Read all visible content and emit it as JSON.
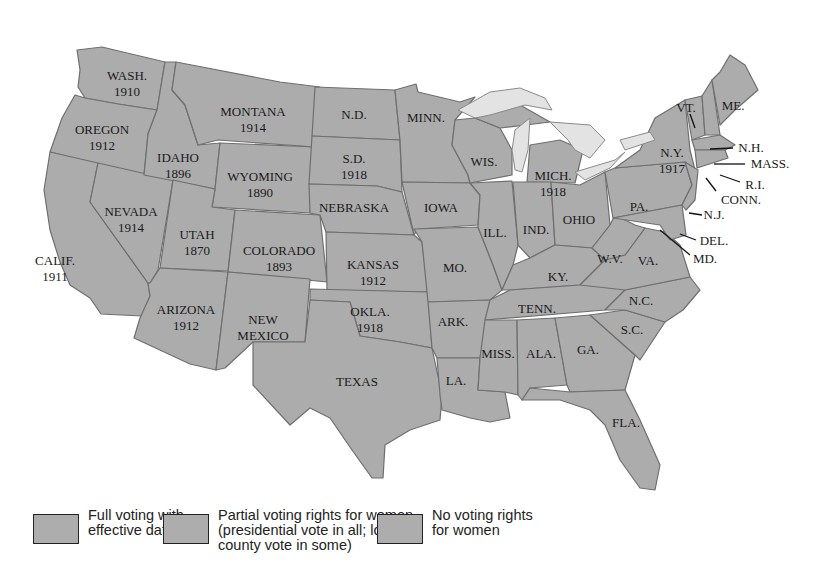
{
  "map": {
    "title": "",
    "colors": {
      "state_fill": "#acacac",
      "border": "#6f6f6f",
      "lake": "#e3e3e3",
      "text": "#1a1a1a"
    },
    "states": [
      {
        "abbr": "WASH.",
        "year": "1910"
      },
      {
        "abbr": "OREGON",
        "year": "1912"
      },
      {
        "abbr": "CALIF.",
        "year": "1911"
      },
      {
        "abbr": "NEVADA",
        "year": "1914"
      },
      {
        "abbr": "IDAHO",
        "year": "1896"
      },
      {
        "abbr": "MONTANA",
        "year": "1914"
      },
      {
        "abbr": "WYOMING",
        "year": "1890"
      },
      {
        "abbr": "UTAH",
        "year": "1870"
      },
      {
        "abbr": "COLORADO",
        "year": "1893"
      },
      {
        "abbr": "ARIZONA",
        "year": "1912"
      },
      {
        "abbr": "NEW",
        "year": "MEXICO"
      },
      {
        "abbr": "N.D.",
        "year": ""
      },
      {
        "abbr": "S.D.",
        "year": "1918"
      },
      {
        "abbr": "NEBRASKA",
        "year": ""
      },
      {
        "abbr": "KANSAS",
        "year": "1912"
      },
      {
        "abbr": "OKLA.",
        "year": "1918"
      },
      {
        "abbr": "TEXAS",
        "year": ""
      },
      {
        "abbr": "MINN.",
        "year": ""
      },
      {
        "abbr": "IOWA",
        "year": ""
      },
      {
        "abbr": "MO.",
        "year": ""
      },
      {
        "abbr": "ARK.",
        "year": ""
      },
      {
        "abbr": "LA.",
        "year": ""
      },
      {
        "abbr": "WIS.",
        "year": ""
      },
      {
        "abbr": "ILL.",
        "year": ""
      },
      {
        "abbr": "MICH.",
        "year": "1918"
      },
      {
        "abbr": "IND.",
        "year": ""
      },
      {
        "abbr": "OHIO",
        "year": ""
      },
      {
        "abbr": "KY.",
        "year": ""
      },
      {
        "abbr": "TENN.",
        "year": ""
      },
      {
        "abbr": "MISS.",
        "year": ""
      },
      {
        "abbr": "ALA.",
        "year": ""
      },
      {
        "abbr": "GA.",
        "year": ""
      },
      {
        "abbr": "FLA.",
        "year": ""
      },
      {
        "abbr": "S.C.",
        "year": ""
      },
      {
        "abbr": "N.C.",
        "year": ""
      },
      {
        "abbr": "VA.",
        "year": ""
      },
      {
        "abbr": "W.V.",
        "year": ""
      },
      {
        "abbr": "PA.",
        "year": ""
      },
      {
        "abbr": "N.Y.",
        "year": "1917"
      },
      {
        "abbr": "VT.",
        "year": ""
      },
      {
        "abbr": "ME.",
        "year": ""
      },
      {
        "abbr": "N.H.",
        "year": ""
      },
      {
        "abbr": "MASS.",
        "year": ""
      },
      {
        "abbr": "R.I.",
        "year": ""
      },
      {
        "abbr": "CONN.",
        "year": ""
      },
      {
        "abbr": "N.J.",
        "year": ""
      },
      {
        "abbr": "DEL.",
        "year": ""
      },
      {
        "abbr": "MD.",
        "year": ""
      }
    ]
  },
  "legend": {
    "items": [
      {
        "label": "Full voting with\neffective date"
      },
      {
        "label": "Partial voting rights for women\n(presidential vote in all; local,\ncounty vote in some)"
      },
      {
        "label": "No voting rights\nfor women"
      }
    ]
  }
}
